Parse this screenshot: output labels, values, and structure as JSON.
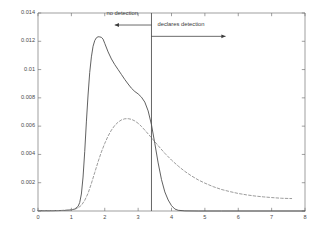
{
  "chart_data": {
    "type": "line",
    "title": "",
    "xlabel": "",
    "ylabel": "",
    "xlim": [
      0,
      8
    ],
    "ylim": [
      0,
      0.014
    ],
    "grid": false,
    "legend": "none",
    "xticks": [
      "0",
      "1",
      "2",
      "3",
      "4",
      "5",
      "6",
      "7",
      "8"
    ],
    "xtick_values": [
      0,
      1,
      2,
      3,
      4,
      5,
      6,
      7,
      8
    ],
    "yticks": [
      "0",
      "0.002",
      "0.004",
      "0.006",
      "0.008",
      "0.01",
      "0.012",
      "0.014"
    ],
    "ytick_values": [
      0,
      0.002,
      0.004,
      0.006,
      0.008,
      0.01,
      0.012,
      0.014
    ],
    "series": [
      {
        "name": "solid-curve",
        "style": "solid",
        "color": "#444444",
        "x": [
          0.0,
          0.2,
          0.4,
          0.6,
          0.8,
          1.0,
          1.1,
          1.2,
          1.25,
          1.3,
          1.35,
          1.4,
          1.45,
          1.5,
          1.55,
          1.6,
          1.65,
          1.7,
          1.75,
          1.8,
          1.85,
          1.9,
          1.95,
          2.0,
          2.1,
          2.2,
          2.3,
          2.4,
          2.5,
          2.6,
          2.7,
          2.8,
          2.9,
          3.0,
          3.1,
          3.2,
          3.3,
          3.4,
          3.5,
          3.6,
          3.7,
          3.8,
          3.9,
          4.0,
          4.1,
          4.2,
          4.4,
          4.8,
          5.5,
          6.5,
          8.0
        ],
        "y": [
          2e-05,
          2e-05,
          2e-05,
          3e-05,
          4e-05,
          8e-05,
          0.00014,
          0.00032,
          0.0006,
          0.0012,
          0.0024,
          0.0042,
          0.0063,
          0.0082,
          0.0098,
          0.0109,
          0.01165,
          0.01205,
          0.01225,
          0.01232,
          0.01231,
          0.01228,
          0.01215,
          0.01185,
          0.01125,
          0.01075,
          0.01035,
          0.01,
          0.00965,
          0.0093,
          0.00898,
          0.00868,
          0.00845,
          0.00828,
          0.00805,
          0.0077,
          0.00708,
          0.0061,
          0.00478,
          0.0034,
          0.00222,
          0.00135,
          0.00078,
          0.00038,
          0.00014,
          5e-05,
          1e-05,
          0.0,
          0.0,
          0.0,
          0.0
        ]
      },
      {
        "name": "dashed-curve",
        "style": "dashed",
        "color": "#8a8a8a",
        "x": [
          0.0,
          0.3,
          0.6,
          0.9,
          1.1,
          1.2,
          1.3,
          1.4,
          1.5,
          1.6,
          1.7,
          1.8,
          1.9,
          2.0,
          2.1,
          2.2,
          2.3,
          2.4,
          2.5,
          2.6,
          2.7,
          2.8,
          2.9,
          3.0,
          3.1,
          3.2,
          3.3,
          3.4,
          3.5,
          3.6,
          3.8,
          4.0,
          4.2,
          4.4,
          4.6,
          4.8,
          5.0,
          5.25,
          5.5,
          5.75,
          6.0,
          6.25,
          6.5,
          6.75,
          7.0,
          7.3,
          7.6
        ],
        "y": [
          2e-05,
          2e-05,
          3e-05,
          6e-05,
          0.00012,
          0.00022,
          0.0004,
          0.00075,
          0.00125,
          0.00195,
          0.00272,
          0.00348,
          0.00418,
          0.00478,
          0.0053,
          0.00572,
          0.00605,
          0.00628,
          0.00644,
          0.00652,
          0.00653,
          0.00648,
          0.00637,
          0.0062,
          0.00598,
          0.00572,
          0.00545,
          0.00518,
          0.0049,
          0.00462,
          0.00408,
          0.0036,
          0.00318,
          0.0028,
          0.00248,
          0.0022,
          0.00197,
          0.00172,
          0.00152,
          0.00137,
          0.00124,
          0.00114,
          0.00106,
          0.001,
          0.00095,
          0.0009,
          0.00088
        ]
      }
    ],
    "annotations": [
      {
        "name": "no-detection-label",
        "text": "no detection",
        "x": 2.05,
        "y": 0.01395,
        "arrow": {
          "from_x": 3.4,
          "to_x": 2.3,
          "y": 0.01315,
          "direction": "left"
        }
      },
      {
        "name": "declares-detection-label",
        "text": "declares detection",
        "x": 3.58,
        "y": 0.01315,
        "arrow": {
          "from_x": 3.4,
          "to_x": 5.62,
          "y": 0.01235,
          "direction": "right"
        }
      }
    ],
    "vertical_line": {
      "name": "threshold-line",
      "x": 3.4,
      "color": "#555555"
    }
  }
}
